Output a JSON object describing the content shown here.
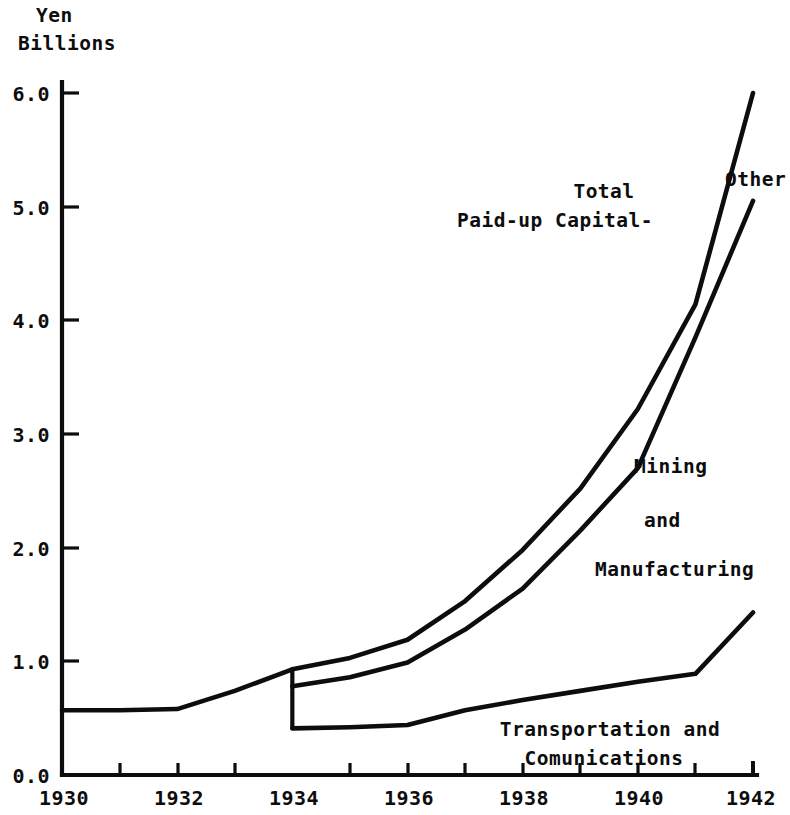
{
  "chart_data": {
    "type": "line",
    "title": "",
    "ylabel_lines": [
      "Yen",
      "Billions"
    ],
    "xlabel": "",
    "xlim": [
      1930,
      1942
    ],
    "ylim": [
      0.0,
      6.0
    ],
    "grid": false,
    "legend_position": "inline-annotations",
    "y_ticks": [
      "6.0",
      "5.0",
      "4.0",
      "3.0",
      "2.0",
      "1.0",
      "0.0"
    ],
    "y_tick_values": [
      6.0,
      5.0,
      4.0,
      3.0,
      2.0,
      1.0,
      0.0
    ],
    "x_ticks": [
      "1930",
      "1932",
      "1934",
      "1936",
      "1938",
      "1940",
      "1942"
    ],
    "x_tick_values": [
      1930,
      1932,
      1934,
      1936,
      1938,
      1940,
      1942
    ],
    "x_minor_ticks": [
      1931,
      1933,
      1935,
      1937,
      1939,
      1941
    ],
    "note": "Series are split at 1934 by a vertical break; before 1934 only a single combined paid-up capital line is plotted.",
    "series": [
      {
        "name": "Combined Paid-up Capital (pre-1934)",
        "x": [
          1930,
          1931,
          1932,
          1933,
          1934
        ],
        "values": [
          0.57,
          0.57,
          0.58,
          0.74,
          0.93
        ]
      },
      {
        "name": "Total Paid-up Capital",
        "x": [
          1934,
          1935,
          1936,
          1937,
          1938,
          1939,
          1940,
          1941,
          1942
        ],
        "values": [
          0.93,
          1.03,
          1.19,
          1.53,
          1.98,
          2.52,
          3.22,
          4.14,
          6.0
        ]
      },
      {
        "name": "Mining and Manufacturing",
        "x": [
          1934,
          1935,
          1936,
          1937,
          1938,
          1939,
          1940,
          1941,
          1942
        ],
        "values": [
          0.78,
          0.86,
          0.99,
          1.28,
          1.64,
          2.15,
          2.7,
          3.85,
          5.05
        ]
      },
      {
        "name": "Transportation and Comunications",
        "x": [
          1934,
          1935,
          1936,
          1937,
          1938,
          1939,
          1940,
          1941,
          1942
        ],
        "values": [
          0.41,
          0.42,
          0.44,
          0.57,
          0.66,
          0.74,
          0.82,
          0.89,
          1.43
        ]
      }
    ],
    "annotations": [
      {
        "text_lines": [
          "Total",
          "Paid-up Capital-"
        ],
        "target_series": "Total Paid-up Capital"
      },
      {
        "text_lines": [
          "Other"
        ],
        "target_series": "gap between total and mining"
      },
      {
        "text_lines": [
          "Mining",
          "and",
          "Manufacturing"
        ],
        "target_series": "Mining and Manufacturing"
      },
      {
        "text_lines": [
          "Transportation and",
          "Comunications"
        ],
        "target_series": "Transportation and Comunications"
      }
    ]
  },
  "axis_title": {
    "line1": "Yen",
    "line2": "Billions"
  },
  "y_axis": {
    "labels": [
      "6.0",
      "5.0",
      "4.0",
      "3.0",
      "2.0",
      "1.0",
      "0.0"
    ]
  },
  "x_axis": {
    "labels": [
      "1930",
      "1932",
      "1934",
      "1936",
      "1938",
      "1940",
      "1942"
    ]
  },
  "labels": {
    "total_line1": "Total",
    "total_line2": "Paid-up Capital-",
    "other": "Other",
    "mining_line1": "Mining",
    "mining_line2": "and",
    "mining_line3": "Manufacturing",
    "transport_line1": "Transportation and",
    "transport_line2": "Comunications"
  },
  "colors": {
    "ink": "#0d0d0d",
    "background": "#ffffff"
  }
}
